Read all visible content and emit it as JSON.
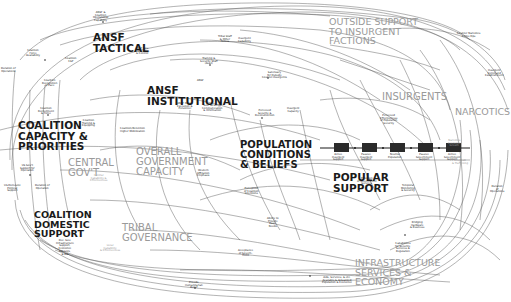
{
  "diagram": {
    "sectors": [
      {
        "id": "ansf-tactical",
        "label": "ANSF\nTACTICAL",
        "tone": "dark",
        "x": 93,
        "y": 32,
        "size": 10.5
      },
      {
        "id": "ansf-institutional",
        "label": "ANSF\nINSTITUTIONAL",
        "tone": "dark",
        "x": 147,
        "y": 85,
        "size": 10.5
      },
      {
        "id": "coalition-capacity",
        "label": "COALITION\nCAPACITY &\nPRIORITIES",
        "tone": "dark",
        "x": 18,
        "y": 120,
        "size": 10.5
      },
      {
        "id": "coalition-domestic",
        "label": "COALITION\nDOMESTIC\nSUPPORT",
        "tone": "dark",
        "x": 34,
        "y": 210,
        "size": 9.5
      },
      {
        "id": "outside-support",
        "label": "OUTSIDE SUPPORT\nTO INSURGENT\nFACTIONS",
        "tone": "gray",
        "x": 329,
        "y": 17,
        "size": 9.5
      },
      {
        "id": "insurgents",
        "label": "INSURGENTS",
        "tone": "gray",
        "x": 382,
        "y": 92,
        "size": 10
      },
      {
        "id": "narcotics",
        "label": "NARCOTICS",
        "tone": "gray",
        "x": 455,
        "y": 107,
        "size": 9.5
      },
      {
        "id": "central-govt",
        "label": "CENTRAL\nGOV'T",
        "tone": "gray",
        "x": 68,
        "y": 158,
        "size": 10
      },
      {
        "id": "overall-government",
        "label": "OVERALL\nGOVERNMENT\nCAPACITY",
        "tone": "gray",
        "x": 136,
        "y": 147,
        "size": 10
      },
      {
        "id": "population",
        "label": "POPULATION\nCONDITIONS\n& BELIEFS",
        "tone": "dark",
        "x": 240,
        "y": 140,
        "size": 10
      },
      {
        "id": "popular-support",
        "label": "POPULAR\nSUPPORT",
        "tone": "dark",
        "x": 333,
        "y": 172,
        "size": 10.5
      },
      {
        "id": "tribal-governance",
        "label": "TRIBAL\nGOVERNANCE",
        "tone": "gray",
        "x": 122,
        "y": 223,
        "size": 10
      },
      {
        "id": "infrastructure",
        "label": "INFRASTRUCTURE\nSERVICES &\nECONOMY",
        "tone": "gray",
        "x": 355,
        "y": 258,
        "size": 9.5
      }
    ],
    "nodes": [
      {
        "label": "ANSF &\nCoalition\nOperational\nCapability",
        "x": 103,
        "y": 12,
        "tone": "dark"
      },
      {
        "label": "Coalition\nForce\nAvailability",
        "x": 36,
        "y": 50,
        "tone": "dark"
      },
      {
        "label": "Duration of\nOperations",
        "x": 11,
        "y": 68,
        "tone": "dark"
      },
      {
        "label": "Coalition\nRecognition\nof Pace",
        "x": 52,
        "y": 80,
        "tone": "dark"
      },
      {
        "label": "Coalition\nCSP",
        "x": 75,
        "y": 58,
        "tone": "dark"
      },
      {
        "label": "ANSF Gov.\nLeadership\n& Control",
        "x": 145,
        "y": 48,
        "tone": "dark"
      },
      {
        "label": "Training &\nSecurity Staff\n(Avail)",
        "x": 210,
        "y": 58,
        "tone": "dark"
      },
      {
        "label": "Tribal Staff\n& Other\nForces",
        "x": 228,
        "y": 36,
        "tone": "dark"
      },
      {
        "label": "Insurgent\nCapability",
        "x": 248,
        "y": 38,
        "tone": "dark"
      },
      {
        "label": "Sanctuary\nfor Outside\nCounter-Insurgents",
        "x": 272,
        "y": 72,
        "tone": "dark"
      },
      {
        "label": "ANSF",
        "x": 207,
        "y": 80,
        "tone": "dark"
      },
      {
        "label": "Perceived\nSecurity &\nReconstruction",
        "x": 265,
        "y": 110,
        "tone": "dark"
      },
      {
        "label": "Insurgent\nCapacity",
        "x": 297,
        "y": 108,
        "tone": "dark"
      },
      {
        "label": "Gov. Strategy\nCommunication\n& Information",
        "x": 212,
        "y": 105,
        "tone": "dark"
      },
      {
        "label": "ANSF Policy\nExecution &\nPersonnel",
        "x": 187,
        "y": 103,
        "tone": "dark"
      },
      {
        "label": "Coalition\nRecruitment\n& Force",
        "x": 48,
        "y": 108,
        "tone": "dark"
      },
      {
        "label": "Coalition\nTraining &\nEquipping",
        "x": 92,
        "y": 120,
        "tone": "dark"
      },
      {
        "label": "Coalition/Retention\nHigher Mobilization",
        "x": 130,
        "y": 128,
        "tone": "dark"
      },
      {
        "label": "US Gov't\nSupport for\nOperation",
        "x": 30,
        "y": 165,
        "tone": "dark"
      },
      {
        "label": "US Domestic\nPolitical\nSupport",
        "x": 14,
        "y": 185,
        "tone": "dark"
      },
      {
        "label": "Duration of\nOperation",
        "x": 45,
        "y": 185,
        "tone": "dark"
      },
      {
        "label": "Dec. Gov.\nInfrastructure\nSupport,\nEconomic\nAdvisors,\n& Aid",
        "x": 66,
        "y": 240,
        "tone": "dark"
      },
      {
        "label": "Western\nAffiliation\nEmphasis",
        "x": 207,
        "y": 170,
        "tone": "dark"
      },
      {
        "label": "Perception\nof Coalition\nIntentions",
        "x": 254,
        "y": 188,
        "tone": "dark"
      },
      {
        "label": "Ability to\nProvide\nBasic\nNeeds",
        "x": 277,
        "y": 218,
        "tone": "dark"
      },
      {
        "label": "Acceptance\nof Govern-\nment",
        "x": 248,
        "y": 250,
        "tone": "dark"
      },
      {
        "label": "Capabilities\nfor Security,\nServices &\nRegulation",
        "x": 405,
        "y": 243,
        "tone": "dark"
      },
      {
        "label": "Bridging\nHardware\n& Business",
        "x": 420,
        "y": 222,
        "tone": "dark"
      },
      {
        "label": "Provide\nHumanitarian\nRelief",
        "x": 195,
        "y": 282,
        "tone": "dark"
      },
      {
        "label": "Aids, Services, & etc.\nAvailable & Actualized\nPopulation & Economic",
        "x": 332,
        "y": 277,
        "tone": "dark"
      },
      {
        "label": "Counter Narcotics\nCrime Ops",
        "x": 467,
        "y": 33,
        "tone": "dark"
      },
      {
        "label": "Insurgent\nCommand\nEstablishment",
        "x": 495,
        "y": 70,
        "tone": "dark"
      },
      {
        "label": "Duration\nof\nOperations",
        "x": 500,
        "y": 186,
        "tone": "dark"
      },
      {
        "label": "Temporal\nMonitoring\n& Security",
        "x": 411,
        "y": 185,
        "tone": "dark"
      },
      {
        "label": "Perceived\nEffectiveness\nof Population\nSecurity",
        "x": 390,
        "y": 115,
        "tone": "dark"
      },
      {
        "label": "Provision\nof Government\nServices",
        "x": 367,
        "y": 178,
        "tone": "dark"
      },
      {
        "label": "Central\nCapability &\nEffectiveness",
        "x": 100,
        "y": 175,
        "tone": "gray"
      },
      {
        "label": "Local\nCapability\n& Effectiveness",
        "x": 110,
        "y": 245,
        "tone": "gray"
      },
      {
        "label": "Narcotics\nEconomic\nGrowth",
        "x": 458,
        "y": 140,
        "tone": "gray"
      },
      {
        "label": "Drug Lab\n& Trafficking",
        "x": 462,
        "y": 160,
        "tone": "gray"
      }
    ],
    "support_chain_boxes": [
      {
        "label": "Active\nInsurgent\nSupport",
        "x": 334,
        "y": 143
      },
      {
        "label": "Passive\nInsurgent\nSupport",
        "x": 362,
        "y": 143
      },
      {
        "label": "Neutral\nPopulation",
        "x": 390,
        "y": 143
      },
      {
        "label": "Passive\nGovernment\nSupport",
        "x": 418,
        "y": 143
      },
      {
        "label": "Active\nGovernment\nSupport",
        "x": 446,
        "y": 143
      }
    ],
    "colors": {
      "background": "#ffffff",
      "line": "#3a3a3a",
      "dark_text": "#1a1a1a",
      "gray_text": "#9a9a9a",
      "stock_box": "#2b2b2b"
    }
  }
}
